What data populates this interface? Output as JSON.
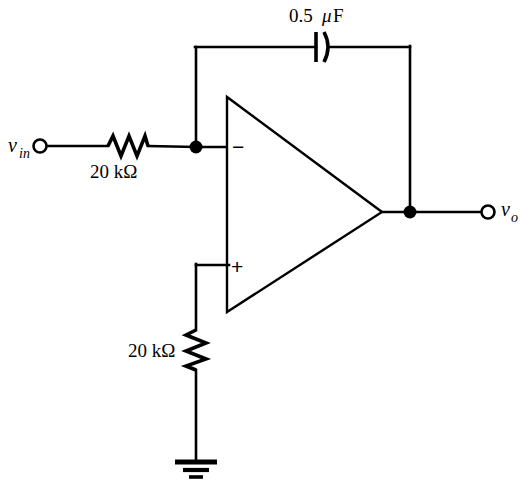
{
  "figure": {
    "type": "circuit-schematic",
    "name": "inverting-op-amp-integrator",
    "background_color": "#ffffff",
    "line_color": "#000000",
    "width": 520,
    "height": 491
  },
  "labels": {
    "input_terminal": "v",
    "input_terminal_subscript": "in",
    "output_terminal": "v",
    "output_terminal_subscript": "o",
    "capacitor_value": "0.5",
    "capacitor_unit_mu": "μ",
    "capacitor_unit_f": "F",
    "resistor_input_value": "20 kΩ",
    "resistor_ground_value": "20 kΩ",
    "inverting_sign": "−",
    "noninverting_sign": "+"
  },
  "components": {
    "op_amp": {
      "name": "operational-amplifier",
      "shape": "triangle",
      "left_x": 227,
      "top_y": 97,
      "bottom_y": 312,
      "apex_x": 382,
      "apex_y": 212
    },
    "resistor_input": {
      "name": "input-resistor",
      "value": "20 kΩ",
      "orientation": "horizontal",
      "x_start": 108,
      "x_end": 148,
      "y": 146
    },
    "resistor_ground": {
      "name": "ground-resistor",
      "value": "20 kΩ",
      "orientation": "vertical",
      "x": 196,
      "y_start": 330,
      "y_end": 370
    },
    "capacitor_feedback": {
      "name": "feedback-capacitor",
      "value": "0.5 μF",
      "style": "polarized",
      "x": 322,
      "y": 47
    },
    "ground": {
      "name": "ground-symbol",
      "x": 196,
      "y": 462,
      "bars": 3
    },
    "nodes": [
      {
        "name": "inverting-input-node",
        "x": 196,
        "y": 147
      },
      {
        "name": "output-node",
        "x": 410,
        "y": 212
      }
    ],
    "terminals": [
      {
        "name": "input-terminal",
        "x": 40,
        "y": 146,
        "radius": 6.5
      },
      {
        "name": "output-terminal",
        "x": 488,
        "y": 212,
        "radius": 6.5
      }
    ]
  },
  "wires": {
    "input_branch": "from input terminal (40,146) through 20k resistor to node (196,147) then to op-amp inverting input (227,147)",
    "feedback_branch": "from node (196,147) up to (196,47), right through 0.5uF capacitor to (410,47), down to output node (410,212)",
    "noninverting_branch": "from op-amp + input (227,265) left to (196,265) down through 20k resistor to ground (196,462)",
    "output_branch": "from op-amp apex (382,212) right through node (410,212) to output terminal (488,212)"
  }
}
